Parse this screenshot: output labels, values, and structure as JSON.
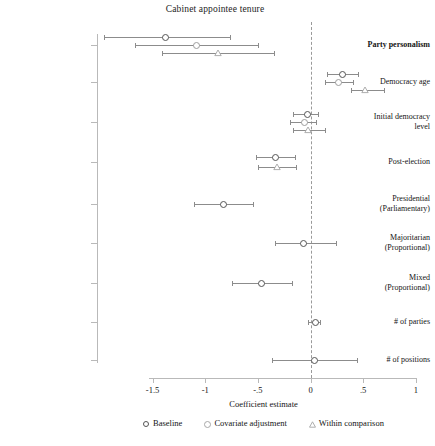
{
  "chart_data": {
    "type": "scatter",
    "title": "Cabinet appointee tenure",
    "xlabel": "Coefficient estimate",
    "ylabel": "",
    "xlim": [
      -1.75,
      1.05
    ],
    "xticks": [
      -1.5,
      -1,
      -0.5,
      0,
      0.5,
      1
    ],
    "xticklabels": [
      "-1.5",
      "-1",
      "-.5",
      "0",
      ".5",
      "1"
    ],
    "grid": false,
    "reference_line": 0,
    "legend_position": "bottom",
    "categories": [
      "Party personalism",
      "Democracy age",
      "Initial democracy level",
      "Post-election",
      "Presidential (Parliamentary)",
      "Majoritarian (Proportional)",
      "Mixed (Proportional)",
      "# of parties",
      "# of positions"
    ],
    "series": [
      {
        "name": "Baseline",
        "marker": "circle-filled",
        "points": [
          {
            "category": "Party personalism",
            "estimate": -1.38,
            "ci_low": -1.96,
            "ci_high": -0.76
          },
          {
            "category": "Democracy age",
            "estimate": 0.3,
            "ci_low": 0.16,
            "ci_high": 0.45
          },
          {
            "category": "Initial democracy level",
            "estimate": -0.03,
            "ci_low": -0.17,
            "ci_high": 0.07
          },
          {
            "category": "Post-election",
            "estimate": -0.34,
            "ci_low": -0.52,
            "ci_high": -0.15
          },
          {
            "category": "Presidential (Parliamentary)",
            "estimate": -0.83,
            "ci_low": -1.11,
            "ci_high": -0.55
          },
          {
            "category": "Majoritarian (Proportional)",
            "estimate": -0.07,
            "ci_low": -0.34,
            "ci_high": 0.24
          },
          {
            "category": "Mixed (Proportional)",
            "estimate": -0.47,
            "ci_low": -0.75,
            "ci_high": -0.18
          },
          {
            "category": "# of parties",
            "estimate": 0.04,
            "ci_low": -0.02,
            "ci_high": 0.09
          },
          {
            "category": "# of positions",
            "estimate": 0.03,
            "ci_low": -0.37,
            "ci_high": 0.44
          }
        ]
      },
      {
        "name": "Covariate adjustment",
        "marker": "circle-open",
        "points": [
          {
            "category": "Party personalism",
            "estimate": -1.09,
            "ci_low": -1.67,
            "ci_high": -0.5
          },
          {
            "category": "Democracy age",
            "estimate": 0.26,
            "ci_low": 0.14,
            "ci_high": 0.4
          },
          {
            "category": "Initial democracy level",
            "estimate": -0.06,
            "ci_low": -0.19,
            "ci_high": 0.05
          }
        ]
      },
      {
        "name": "Within comparison",
        "marker": "triangle-open",
        "points": [
          {
            "category": "Party personalism",
            "estimate": -0.88,
            "ci_low": -1.41,
            "ci_high": -0.35
          },
          {
            "category": "Democracy age",
            "estimate": 0.52,
            "ci_low": 0.38,
            "ci_high": 0.7
          },
          {
            "category": "Initial democracy level",
            "estimate": -0.02,
            "ci_low": -0.17,
            "ci_high": 0.14
          },
          {
            "category": "Post-election",
            "estimate": -0.32,
            "ci_low": -0.5,
            "ci_high": -0.14
          }
        ]
      }
    ]
  },
  "legend": {
    "items": [
      {
        "label": "Baseline",
        "glyph": "circle-filled-icon"
      },
      {
        "label": "Covariate adjustment",
        "glyph": "circle-open-icon"
      },
      {
        "label": "Within comparison",
        "glyph": "triangle-open-icon"
      }
    ]
  },
  "colors": {
    "marker_baseline": "#555555",
    "marker_covariate": "#9d9d9d",
    "marker_within": "#a5a5a5",
    "ci_line": "#8c8c8c",
    "axis": "#b9b9b9",
    "reference_line": "#9a9a9a",
    "text": "#141414",
    "background": "#ffffff"
  }
}
